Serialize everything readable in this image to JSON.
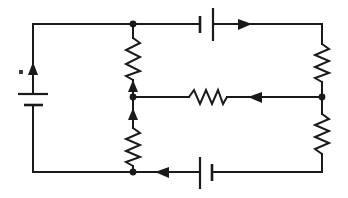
{
  "figure": {
    "type": "circuit-diagram",
    "width": 348,
    "height": 198,
    "background_color": "#ffffff",
    "line_color": "#1a1a1a"
  },
  "components": {
    "batteries": [
      {
        "id": "battery-left",
        "label": "battery-left",
        "orientation": "vertical",
        "position": "left-branch",
        "long_plate": "top",
        "x": 33,
        "y": 99
      },
      {
        "id": "battery-top",
        "label": "battery-top",
        "orientation": "vertical-plates-horizontal-wire",
        "position": "top-branch",
        "long_plate": "right",
        "x": 207,
        "y": 24
      },
      {
        "id": "battery-bottom",
        "label": "battery-bottom",
        "orientation": "vertical-plates-horizontal-wire",
        "position": "bottom-branch",
        "long_plate": "left",
        "x": 206,
        "y": 172
      }
    ],
    "resistors": [
      {
        "id": "resistor-upper-left",
        "label": "resistor-upper-left",
        "orientation": "vertical",
        "x": 133,
        "y_top": 38,
        "y_bottom": 80
      },
      {
        "id": "resistor-lower-left",
        "label": "resistor-lower-left",
        "orientation": "vertical",
        "x": 133,
        "y_top": 128,
        "y_bottom": 166
      },
      {
        "id": "resistor-middle",
        "label": "resistor-middle",
        "orientation": "horizontal",
        "y": 97,
        "x_left": 189,
        "x_right": 227
      },
      {
        "id": "resistor-upper-right",
        "label": "resistor-upper-right",
        "orientation": "vertical",
        "x": 322,
        "y_top": 44,
        "y_bottom": 82
      },
      {
        "id": "resistor-lower-right",
        "label": "resistor-lower-right",
        "orientation": "vertical",
        "x": 322,
        "y_top": 114,
        "y_bottom": 154
      }
    ],
    "current_arrows": [
      {
        "id": "arrow-left-branch",
        "label": "current-arrow-left-up",
        "direction": "up",
        "x": 33,
        "y": 70
      },
      {
        "id": "arrow-top-branch",
        "label": "current-arrow-top-right",
        "direction": "right",
        "x": 243,
        "y": 24
      },
      {
        "id": "arrow-upper-left-resistor",
        "label": "current-arrow-upper-left-up",
        "direction": "up",
        "x": 133,
        "y": 86
      },
      {
        "id": "arrow-lower-left-resistor",
        "label": "current-arrow-lower-left-up",
        "direction": "up",
        "x": 133,
        "y": 115
      },
      {
        "id": "arrow-middle-branch",
        "label": "current-arrow-middle-left",
        "direction": "left",
        "x": 258,
        "y": 97
      },
      {
        "id": "arrow-bottom-branch",
        "label": "current-arrow-bottom-left",
        "direction": "left",
        "x": 164,
        "y": 172
      }
    ],
    "junction_nodes": [
      {
        "id": "node-top-left-branch",
        "label": "junction-top-left",
        "x": 133,
        "y": 24
      },
      {
        "id": "node-middle-left-branch",
        "label": "junction-middle-left",
        "x": 133,
        "y": 97
      },
      {
        "id": "node-bottom-left-branch",
        "label": "junction-bottom-left",
        "x": 133,
        "y": 172
      },
      {
        "id": "node-middle-right-branch",
        "label": "junction-middle-right",
        "x": 322,
        "y": 97
      }
    ],
    "outer_loop": {
      "id": "outer-loop-wire",
      "label": "outer-loop",
      "left": 33,
      "right": 322,
      "top": 24,
      "bottom": 172
    },
    "stray_marks": [
      {
        "id": "stray-dot",
        "label": "stray-ink-dot",
        "x": 21,
        "y": 72
      }
    ]
  }
}
